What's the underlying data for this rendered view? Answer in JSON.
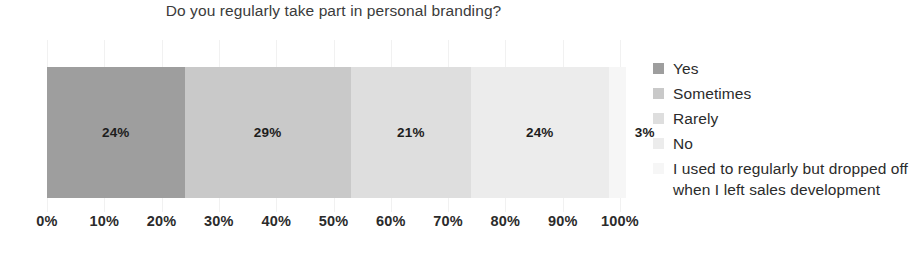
{
  "chart_data": {
    "type": "bar",
    "orientation": "horizontal",
    "stacked": true,
    "title": "Do you regularly take part in personal branding?",
    "xlabel": "",
    "ylabel": "",
    "xlim": [
      0,
      100
    ],
    "grid": true,
    "legend_position": "right",
    "categories": [
      ""
    ],
    "x_tick_labels": [
      "0%",
      "10%",
      "20%",
      "30%",
      "40%",
      "50%",
      "60%",
      "70%",
      "80%",
      "90%",
      "100%"
    ],
    "x_tick_values": [
      0,
      10,
      20,
      30,
      40,
      50,
      60,
      70,
      80,
      90,
      100
    ],
    "series": [
      {
        "name": "Yes",
        "values": [
          24
        ],
        "data_label": "24%",
        "color": "#9e9e9e"
      },
      {
        "name": "Sometimes",
        "values": [
          29
        ],
        "data_label": "29%",
        "color": "#c9c9c9"
      },
      {
        "name": "Rarely",
        "values": [
          21
        ],
        "data_label": "21%",
        "color": "#dedede"
      },
      {
        "name": "No",
        "values": [
          24
        ],
        "data_label": "24%",
        "color": "#ececec"
      },
      {
        "name": "I used to regularly but dropped off when I left sales development",
        "values": [
          3
        ],
        "data_label": "3%",
        "color": "#f6f6f6"
      }
    ]
  }
}
